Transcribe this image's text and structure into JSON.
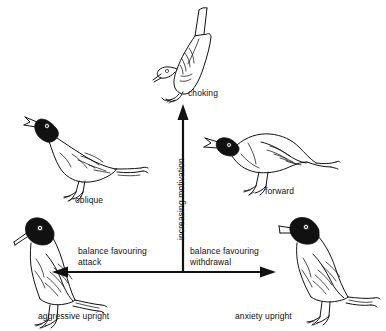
{
  "diagram": {
    "type": "behavioural-motivation-diagram",
    "background_color": "#ffffff",
    "ink_color": "#111111"
  },
  "axes": {
    "vertical": {
      "label": "increasing motivation",
      "direction": "up",
      "orientation": "vertical",
      "arrow_tip_label": "choking"
    },
    "horizontal_left": {
      "label": "balance favouring\nattack",
      "line1": "balance favouring",
      "line2": "attack",
      "direction": "left",
      "arrow_tip_label": "aggressive upright"
    },
    "horizontal_right": {
      "label": "balance favouring\nwithdrawal",
      "line1": "balance favouring",
      "line2": "withdrawal",
      "direction": "right",
      "arrow_tip_label": "anxiety upright"
    }
  },
  "postures": [
    {
      "id": "choking",
      "label": "choking",
      "position": "top-center"
    },
    {
      "id": "oblique",
      "label": "oblique",
      "position": "middle-left"
    },
    {
      "id": "forward",
      "label": "forward",
      "position": "middle-right"
    },
    {
      "id": "aggressive-upright",
      "label": "aggressive upright",
      "position": "bottom-left"
    },
    {
      "id": "anxiety-upright",
      "label": "anxiety upright",
      "position": "bottom-right"
    }
  ]
}
